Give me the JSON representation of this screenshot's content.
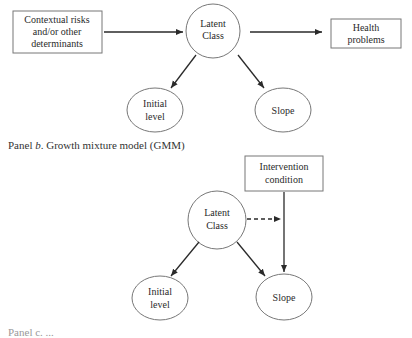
{
  "panel_a": {
    "nodes": {
      "contextual": {
        "line1": "Contextual risks",
        "line2": "and/or other",
        "line3": "determinants"
      },
      "latent": {
        "line1": "Latent",
        "line2": "Class"
      },
      "health": {
        "line1": "Health",
        "line2": "problems"
      },
      "initial": {
        "line1": "Initial",
        "line2": "level"
      },
      "slope": {
        "line1": "Slope"
      }
    }
  },
  "panel_b": {
    "caption_prefix": "Panel ",
    "caption_letter": "b",
    "caption_rest": ". Growth mixture model (GMM)",
    "nodes": {
      "intervention": {
        "line1": "Intervention",
        "line2": "condition"
      },
      "latent": {
        "line1": "Latent",
        "line2": "Class"
      },
      "initial": {
        "line1": "Initial",
        "line2": "level"
      },
      "slope": {
        "line1": "Slope"
      }
    }
  },
  "panel_c": {
    "caption_partial": "Panel c. ..."
  }
}
